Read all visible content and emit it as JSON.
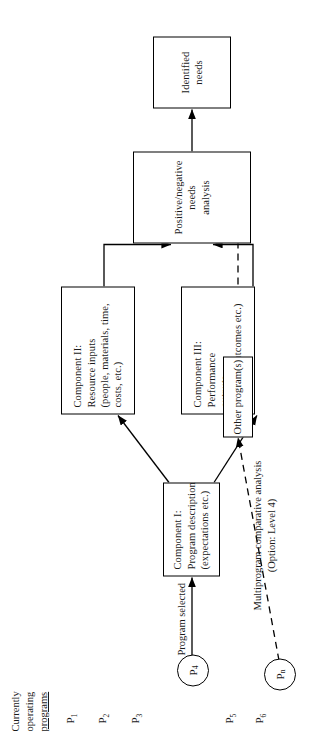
{
  "figure": {
    "title_block": {
      "line1": "Currently",
      "line2": "operating",
      "line3": "programs"
    },
    "program_labels": [
      {
        "name": "P",
        "sub": "1",
        "circled": false
      },
      {
        "name": "P",
        "sub": "2",
        "circled": false
      },
      {
        "name": "P",
        "sub": "3",
        "circled": false
      },
      {
        "name": "P",
        "sub": "4",
        "circled": true
      },
      {
        "name": "P",
        "sub": "5",
        "circled": false
      },
      {
        "name": "P",
        "sub": "6",
        "circled": false
      },
      {
        "name": "P",
        "sub": "n",
        "circled": true
      }
    ],
    "edge_labels": {
      "program_selected": "Program selected",
      "multiprogram_line1": "Multiprogram comparative analysis",
      "multiprogram_line2": "(Option: Level 4)"
    },
    "boxes": {
      "component_i": {
        "line1": "Component I:",
        "line2": "Program description",
        "line3": "(expectations etc.)"
      },
      "component_ii": {
        "line1": "Component II:",
        "line2": "Resource inputs",
        "line3": "(people, materials, time,",
        "line4": "costs, etc.)"
      },
      "component_iii": {
        "line1": "Component III:",
        "line2": "Performance",
        "line3": "outputs",
        "line4": "(learning outcomes etc.)"
      },
      "needs_analysis": {
        "line1": "Positive/negative",
        "line2": "needs",
        "line3": "analysis"
      },
      "identified_needs": {
        "line1": "Identified",
        "line2": "needs"
      },
      "other_programs": {
        "line1": "Other program(s)"
      }
    },
    "colors": {
      "ink": "#1a1a1a",
      "stroke": "#000000",
      "paper": "#ffffff"
    }
  }
}
